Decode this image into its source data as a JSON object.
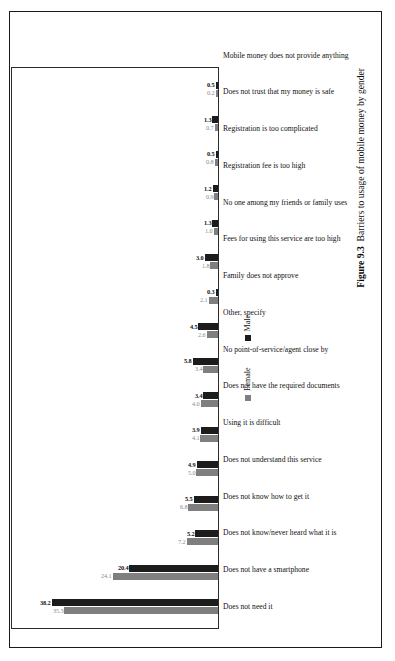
{
  "figure": {
    "number_label": "Figure 9.3",
    "caption": "Barriers to usage of mobile money by gender"
  },
  "legend": {
    "female_label": "Female",
    "male_label": "Male",
    "female_color": "#7f7f7f",
    "male_color": "#1c1c1c"
  },
  "chart_data": {
    "type": "bar",
    "title": "Barriers to usage of mobile money by gender",
    "xlabel": "",
    "ylabel": "",
    "ylim": [
      0,
      45
    ],
    "grid": false,
    "legend_position": "bottom-right",
    "orientation": "vertical-bars-rotated-page",
    "categories": [
      "Does not need it",
      "Does not have a smartphone",
      "Does not know/never heard what it is",
      "Does not know how to get it",
      "Does not understand this service",
      "Using it is difficult",
      "Does not have the required documents",
      "No point-of-service/agent close by",
      "Other, specify",
      "Family does not approve",
      "Fees for using this service are too high",
      "No one among my friends or family uses",
      "Registration fee is too high",
      "Registration is too complicated",
      "Does not trust that my money is safe",
      "Mobile money does not provide anything"
    ],
    "series": [
      {
        "name": "Female",
        "color": "#7f7f7f",
        "values": [
          35.3,
          24.1,
          7.2,
          6.8,
          5.0,
          4.1,
          4.0,
          3.4,
          2.6,
          2.1,
          1.8,
          1.0,
          0.9,
          0.8,
          0.7,
          0.2
        ],
        "labels": [
          "35.3",
          "24.1",
          "7.2",
          "6.8",
          "5.0",
          "4.1",
          "4.0",
          "3.4",
          "2.6",
          "2.1",
          "1.8",
          "1.0",
          "0.9",
          "0.8",
          "0.7",
          "0.2"
        ]
      },
      {
        "name": "Male",
        "color": "#1c1c1c",
        "values": [
          38.2,
          20.4,
          5.2,
          5.5,
          4.9,
          3.9,
          3.4,
          5.8,
          4.5,
          0.3,
          3.0,
          1.3,
          1.2,
          0.5,
          1.3,
          0.5
        ],
        "labels": [
          "38.2",
          "20.4",
          "5.2",
          "5.5",
          "4.9",
          "3.9",
          "3.4",
          "5.8",
          "4.5",
          "0.3",
          "3.0",
          "1.3",
          "1.2",
          "0.5",
          "1.3",
          "0.5"
        ]
      }
    ]
  }
}
